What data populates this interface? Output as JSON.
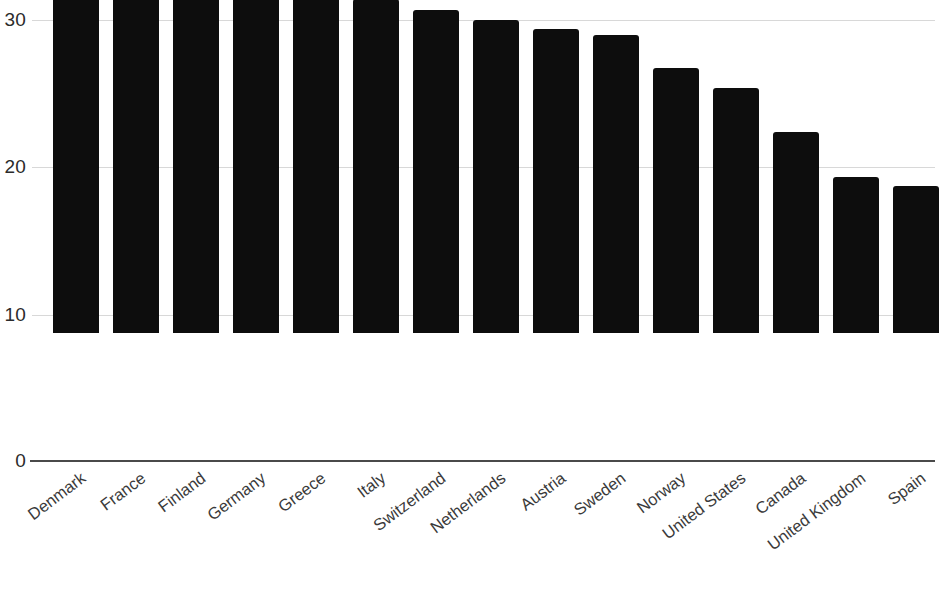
{
  "chart_data": {
    "type": "bar",
    "title": "",
    "subtitle": "",
    "xlabel": "",
    "ylabel": "",
    "categories": [
      "Denmark",
      "France",
      "Finland",
      "Germany",
      "Greece",
      "Italy",
      "Switzerland",
      "Netherlands",
      "Austria",
      "Sweden",
      "Norway",
      "United States",
      "Canada",
      "United Kingdom",
      "Spain"
    ],
    "values": [
      28.2,
      27.0,
      26.7,
      24.6,
      23.2,
      22.7,
      22.0,
      21.3,
      20.7,
      20.3,
      18.0,
      16.7,
      13.7,
      10.6,
      10.0
    ],
    "ylim": [
      0,
      30
    ],
    "yticks": [
      0,
      10,
      20,
      30
    ],
    "ytick_labels": [
      "0",
      "10",
      "20",
      "30"
    ],
    "grid": true,
    "legend": false,
    "legend_position": "none",
    "bar_color": "#0d0d0d",
    "gridline_color": "#d8d8d8",
    "axis_color": "#4a4a4a",
    "background_color": "#ffffff",
    "xtick_rotation": -37
  }
}
